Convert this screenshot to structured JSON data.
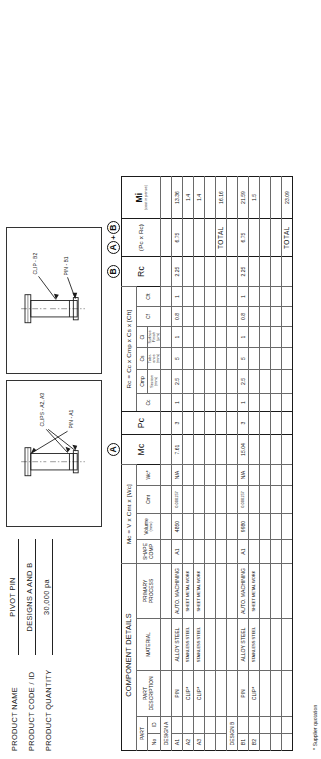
{
  "product_info": [
    {
      "label": "PRODUCT NAME",
      "value": "PIVOT PIN"
    },
    {
      "label": "PRODUCT CODE / ID",
      "value": "DESIGNS A AND B"
    },
    {
      "label": "PRODUCT QUANTITY",
      "value": "30,000 pa"
    }
  ],
  "drawings": [
    {
      "name": "design-a-drawing",
      "labels": [
        "CLIPS - A2, A3",
        "PIN - A1"
      ]
    },
    {
      "name": "design-b-drawing",
      "labels": [
        "CLIP - B2",
        "PIN - B1"
      ]
    }
  ],
  "group_headers": {
    "component_details": "COMPONENT DETAILS",
    "mc": "Mc = V x Cmt x [Wc]",
    "mc_short": "Mc",
    "pc": "Pc",
    "rc_formula": "Rc = Cc x Cmp x Cs x [Cft]",
    "rc_short": "Rc",
    "b_group": "(Pc x Rc)",
    "mi_group": "Mi",
    "mi_sub": "(cost in pence)"
  },
  "tags": {
    "a": "A",
    "b": "B",
    "a_plus_b": "+"
  },
  "columns": {
    "part_no": "No",
    "part_no_top": "PART",
    "part_id": "ID",
    "part_description": "PART\nDESCRIPTION",
    "part_description_l1": "PART",
    "part_description_l2": "DESCRIPTION",
    "material": "MATERIAL",
    "primary_process_l1": "PRIMARY",
    "primary_process_l2": "PROCESS",
    "shape_comp_l1": "SHAPE",
    "shape_comp_l2": "COMP",
    "volume": "Volume",
    "volume_unit": "(mm³)",
    "cmt": "Cmt",
    "wc": "Wc",
    "wc_star": "*",
    "mc": "Mc",
    "pc": "Pc",
    "cc": "Cc",
    "cmp": "Cmp",
    "cmp_sub_l1": "Section",
    "cmp_sub_l2": "(mm)",
    "cs": "Cs",
    "cs_sub_l1": "Toler-",
    "cs_sub_l2": "ance",
    "cs_sub_l3": "(mm)",
    "ci": "Ci",
    "ci_sub_l1": "Surface",
    "ci_sub_l2": "Finish",
    "ci_sub_l3": "(µm)",
    "cf": "Cf",
    "cft": "Cft",
    "rc": "Rc",
    "pe_rc": "(Pe x Rc)",
    "mi": "Mi",
    "total": "TOTAL"
  },
  "sections": [
    {
      "name": "DESIGN A",
      "rows": [
        {
          "no": "A1",
          "id": "",
          "description": "PIN",
          "material": "ALLOY STEEL",
          "process": "AUTO. MACHINING",
          "shape_comp": "A1",
          "volume": "4850",
          "cmt": "0.000157",
          "wc": "N/A",
          "mc": "7.61",
          "pc": "3",
          "cc": "1",
          "cmp": "2.5",
          "cs": "5",
          "ci": "1",
          "cf": "0.8",
          "cft": "1",
          "rc": "2.25",
          "pe_rc": "6.75",
          "mi": "13.36"
        },
        {
          "no": "A2",
          "id": "",
          "description": "CLIP*",
          "material": "STAINLESS STEEL",
          "process": "SHEET METAL WORK",
          "shape_comp": "",
          "volume": "",
          "cmt": "",
          "wc": "",
          "mc": "",
          "pc": "",
          "cc": "",
          "cmp": "",
          "cs": "",
          "ci": "",
          "cf": "",
          "cft": "",
          "rc": "",
          "pe_rc": "",
          "mi": "1.4"
        },
        {
          "no": "A3",
          "id": "",
          "description": "CLIP*",
          "material": "STAINLESS STEEL",
          "process": "SHEET METAL WORK",
          "shape_comp": "",
          "volume": "",
          "cmt": "",
          "wc": "",
          "mc": "",
          "pc": "",
          "cc": "",
          "cmp": "",
          "cs": "",
          "ci": "",
          "cf": "",
          "cft": "",
          "rc": "",
          "pe_rc": "",
          "mi": "1.4"
        },
        {
          "no": "",
          "id": "",
          "description": "",
          "material": "",
          "process": "",
          "shape_comp": "",
          "volume": "",
          "cmt": "",
          "wc": "",
          "mc": "",
          "pc": "",
          "cc": "",
          "cmp": "",
          "cs": "",
          "ci": "",
          "cf": "",
          "cft": "",
          "rc": "",
          "pe_rc": "",
          "mi": ""
        }
      ],
      "total_label": "TOTAL",
      "total_mi": "16.16"
    },
    {
      "name": "DESIGN B",
      "rows": [
        {
          "no": "B1",
          "id": "",
          "description": "PIN",
          "material": "ALLOY STEEL",
          "process": "AUTO. MACHINING",
          "shape_comp": "A1",
          "volume": "9980",
          "cmt": "0.000157",
          "wc": "N/A",
          "mc": "15.04",
          "pc": "3",
          "cc": "1",
          "cmp": "2.5",
          "cs": "5",
          "ci": "1",
          "cf": "0.8",
          "cft": "1",
          "rc": "2.25",
          "pe_rc": "6.75",
          "mi": "21.59"
        },
        {
          "no": "B2",
          "id": "",
          "description": "CLIP*",
          "material": "STAINLESS STEEL",
          "process": "SHEET METAL WORK",
          "shape_comp": "",
          "volume": "",
          "cmt": "",
          "wc": "",
          "mc": "",
          "pc": "",
          "cc": "",
          "cmp": "",
          "cs": "",
          "ci": "",
          "cf": "",
          "cft": "",
          "rc": "",
          "pe_rc": "",
          "mi": "1.5"
        },
        {
          "no": "",
          "id": "",
          "description": "",
          "material": "",
          "process": "",
          "shape_comp": "",
          "volume": "",
          "cmt": "",
          "wc": "",
          "mc": "",
          "pc": "",
          "cc": "",
          "cmp": "",
          "cs": "",
          "ci": "",
          "cf": "",
          "cft": "",
          "rc": "",
          "pe_rc": "",
          "mi": ""
        },
        {
          "no": "",
          "id": "",
          "description": "",
          "material": "",
          "process": "",
          "shape_comp": "",
          "volume": "",
          "cmt": "",
          "wc": "",
          "mc": "",
          "pc": "",
          "cc": "",
          "cmp": "",
          "cs": "",
          "ci": "",
          "cf": "",
          "cft": "",
          "rc": "",
          "pe_rc": "",
          "mi": ""
        }
      ],
      "total_label": "TOTAL",
      "total_mi": "23.09"
    }
  ],
  "footnote": "* Supplier quotation"
}
